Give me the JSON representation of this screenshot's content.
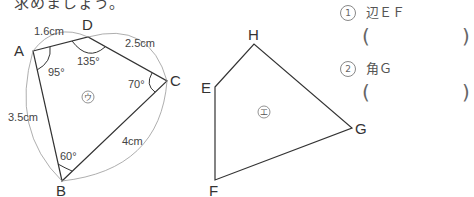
{
  "instruction_fragment": "求めましょう。",
  "figure_u": {
    "label": "ウ",
    "vertices": {
      "A": "A",
      "B": "B",
      "C": "C",
      "D": "D"
    },
    "sides": {
      "AD": "1.6cm",
      "DC": "2.5cm",
      "AB": "3.5cm",
      "BC": "4cm"
    },
    "angles": {
      "A": "95°",
      "D": "135°",
      "C": "70°",
      "B": "60°"
    }
  },
  "figure_e": {
    "label": "エ",
    "vertices": {
      "E": "E",
      "F": "F",
      "G": "G",
      "H": "H"
    }
  },
  "questions": [
    {
      "num": "1",
      "text": "辺ＥＦ",
      "answer": ""
    },
    {
      "num": "2",
      "text": "角Ｇ",
      "answer": ""
    }
  ],
  "colors": {
    "line": "#333333",
    "arc": "#999999",
    "text": "#333333"
  }
}
